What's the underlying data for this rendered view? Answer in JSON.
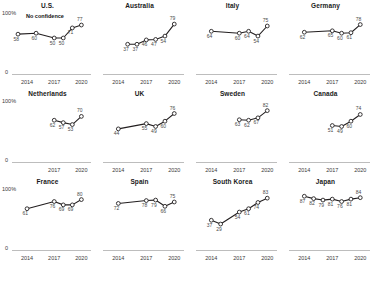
{
  "figure": {
    "axis_top_label": "100%",
    "axis_zero_label": "0",
    "annotation": "No confidence",
    "x_ticks_full": [
      "2014",
      "2017",
      "2020"
    ],
    "x_ticks_short": [
      "2017",
      "2020"
    ],
    "line_color": "#231f20",
    "marker_fill": "#ffffff",
    "marker_stroke": "#231f20"
  },
  "chart_data": {
    "type": "line",
    "title": "",
    "xlabel": "",
    "ylabel": "",
    "ylim": [
      0,
      100
    ],
    "grid": false,
    "legend_position": "none",
    "annotations": [
      "No confidence"
    ],
    "panels": [
      {
        "label": "U.S.",
        "x": [
          2013,
          2015,
          2017,
          2018,
          2019,
          2020
        ],
        "values": [
          58,
          60,
          50,
          50,
          71,
          77
        ],
        "point_labels": [
          "58",
          "60",
          "50",
          "50",
          "71",
          "77"
        ],
        "x_ticks": [
          "2014",
          "2017",
          "2020"
        ],
        "show_y_axis": true
      },
      {
        "label": "Australia",
        "x": [
          2015,
          2016,
          2017,
          2018,
          2019,
          2020
        ],
        "values": [
          37,
          37,
          46,
          47,
          54,
          79
        ],
        "point_labels": [
          "37",
          "37",
          "46",
          "47",
          "54",
          "79"
        ],
        "x_ticks": [
          "2014",
          "2017",
          "2020"
        ],
        "show_y_axis": false
      },
      {
        "label": "Italy",
        "x": [
          2014,
          2017,
          2018,
          2019,
          2020
        ],
        "values": [
          64,
          60,
          64,
          54,
          75
        ],
        "point_labels": [
          "64",
          "60",
          "64",
          "54",
          "75"
        ],
        "x_ticks": [
          "2014",
          "2017",
          "2020"
        ],
        "show_y_axis": false
      },
      {
        "label": "Germany",
        "x": [
          2014,
          2017,
          2018,
          2019,
          2020
        ],
        "values": [
          62,
          65,
          60,
          61,
          78
        ],
        "point_labels": [
          "62",
          "65",
          "60",
          "61",
          "78"
        ],
        "x_ticks": [
          "2014",
          "2017",
          "2020"
        ],
        "show_y_axis": false
      },
      {
        "label": "Netherlands",
        "x": [
          2017,
          2018,
          2019,
          2020
        ],
        "values": [
          62,
          57,
          53,
          70
        ],
        "point_labels": [
          "62",
          "57",
          "53",
          "70"
        ],
        "x_ticks": [
          "2017",
          "2020"
        ],
        "show_y_axis": true
      },
      {
        "label": "UK",
        "x": [
          2014,
          2017,
          2018,
          2019,
          2020
        ],
        "values": [
          44,
          55,
          49,
          60,
          76
        ],
        "point_labels": [
          "44",
          "55",
          "49",
          "60",
          "76"
        ],
        "x_ticks": [
          "2014",
          "2017",
          "2020"
        ],
        "show_y_axis": false
      },
      {
        "label": "Sweden",
        "x": [
          2017,
          2018,
          2019,
          2020
        ],
        "values": [
          63,
          62,
          67,
          82
        ],
        "point_labels": [
          "63",
          "62",
          "67",
          "82"
        ],
        "x_ticks": [
          "2014",
          "2017",
          "2020"
        ],
        "show_y_axis": false
      },
      {
        "label": "Canada",
        "x": [
          2017,
          2018,
          2019,
          2020
        ],
        "values": [
          51,
          49,
          60,
          74
        ],
        "point_labels": [
          "51",
          "49",
          "60",
          "74"
        ],
        "x_ticks": [
          "2014",
          "2017",
          "2020"
        ],
        "show_y_axis": false
      },
      {
        "label": "France",
        "x": [
          2014,
          2017,
          2018,
          2019,
          2020
        ],
        "values": [
          61,
          76,
          69,
          69,
          80
        ],
        "point_labels": [
          "61",
          "76",
          "69",
          "69",
          "80"
        ],
        "x_ticks": [
          "2014",
          "2017",
          "2020"
        ],
        "show_y_axis": true
      },
      {
        "label": "Spain",
        "x": [
          2014,
          2017,
          2018,
          2019,
          2020
        ],
        "values": [
          72,
          78,
          79,
          66,
          75
        ],
        "point_labels": [
          "72",
          "78",
          "79",
          "66",
          "75"
        ],
        "x_ticks": [
          "2014",
          "2017",
          "2020"
        ],
        "show_y_axis": false
      },
      {
        "label": "South Korea",
        "x": [
          2014,
          2015,
          2017,
          2018,
          2019,
          2020
        ],
        "values": [
          37,
          29,
          54,
          61,
          74,
          83
        ],
        "point_labels": [
          "37",
          "29",
          "54",
          "61",
          "74",
          "83"
        ],
        "x_ticks": [
          "2014",
          "2017",
          "2020"
        ],
        "show_y_axis": false
      },
      {
        "label": "Japan",
        "x": [
          2014,
          2015,
          2016,
          2017,
          2018,
          2019,
          2020
        ],
        "values": [
          87,
          82,
          79,
          81,
          76,
          81,
          84
        ],
        "point_labels": [
          "87",
          "82",
          "79",
          "81",
          "76",
          "81",
          "84"
        ],
        "x_ticks": [
          "2014",
          "2017",
          "2020"
        ],
        "show_y_axis": false
      }
    ]
  }
}
